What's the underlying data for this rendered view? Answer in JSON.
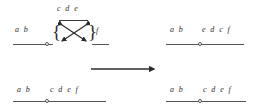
{
  "figure": {
    "background_color": "#ffffff",
    "ink_color": "#2b2b2b",
    "line_color": "#555555"
  },
  "panels": {
    "top_left": {
      "name": "before-crossing-diagram",
      "left_sequence": "a  b",
      "crossing_group_label": "c d e",
      "right_sequence": "f",
      "brace_open": "{",
      "brace_close": "}",
      "crossing_icon": "double-headed-x-crossing-arrows"
    },
    "top_right": {
      "name": "after-crossing-sequence",
      "left_sequence": "a  b",
      "right_sequence": "e d c  f"
    },
    "bottom_left": {
      "name": "initial-sequence",
      "left_sequence": "a  b",
      "right_sequence": "c d e  f"
    },
    "bottom_right": {
      "name": "result-sequence",
      "left_sequence": "a  b",
      "right_sequence": "c d e  f"
    }
  },
  "transform_arrow": {
    "name": "rightward-transformation-arrow",
    "direction": "right"
  }
}
